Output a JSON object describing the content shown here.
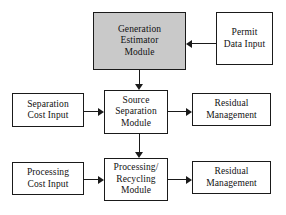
{
  "diagram": {
    "background_color": "#ffffff",
    "line_color": "#1a1a1a",
    "shaded_fill_color": "#c9c9c9",
    "nodes": {
      "generation_estimator": {
        "line1": "Generation",
        "line2": "Estimator",
        "line3": "Module",
        "shaded": "yes"
      },
      "permit_data_input": {
        "line1": "Permit",
        "line2": "Data Input",
        "shaded": "no"
      },
      "separation_cost_input": {
        "line1": "Separation",
        "line2": "Cost Input",
        "shaded": "no"
      },
      "source_separation": {
        "line1": "Source",
        "line2": "Separation",
        "line3": "Module",
        "shaded": "no"
      },
      "residual_management_top": {
        "line1": "Residual",
        "line2": "Management",
        "shaded": "no"
      },
      "processing_cost_input": {
        "line1": "Processing",
        "line2": "Cost Input",
        "shaded": "no"
      },
      "processing_recycling": {
        "line1": "Processing/",
        "line2": "Recycling",
        "line3": "Module",
        "shaded": "no"
      },
      "residual_management_bottom": {
        "line1": "Residual",
        "line2": "Management",
        "shaded": "no"
      }
    },
    "edges": [
      {
        "from": "permit_data_input",
        "to": "generation_estimator",
        "direction": "left"
      },
      {
        "from": "generation_estimator",
        "to": "source_separation",
        "direction": "down"
      },
      {
        "from": "separation_cost_input",
        "to": "source_separation",
        "direction": "right"
      },
      {
        "from": "source_separation",
        "to": "residual_management_top",
        "direction": "right"
      },
      {
        "from": "source_separation",
        "to": "processing_recycling",
        "direction": "down"
      },
      {
        "from": "processing_cost_input",
        "to": "processing_recycling",
        "direction": "right"
      },
      {
        "from": "processing_recycling",
        "to": "residual_management_bottom",
        "direction": "right"
      }
    ]
  }
}
